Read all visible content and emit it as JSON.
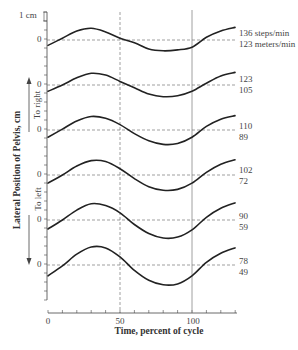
{
  "chart_data": {
    "type": "line",
    "title": "",
    "xlabel": "Time, percent of cycle",
    "ylabel": "Lateral Position of Pelvis, cm",
    "xlim": [
      0,
      130
    ],
    "xticks": [
      "0",
      "50",
      "100"
    ],
    "scale_bar": "1 cm",
    "direction_labels": {
      "up": "To right",
      "down": "To left"
    },
    "reference_lines": {
      "vertical_dashed": 50,
      "vertical_solid": 100
    },
    "series": [
      {
        "name": "136 steps/min, 123 meters/min",
        "cadence": "136 steps/min",
        "speed": "123 meters/min",
        "x": [
          0,
          10,
          20,
          30,
          40,
          50,
          60,
          70,
          80,
          90,
          100,
          110,
          120,
          130
        ],
        "values": [
          -0.6,
          0.2,
          1.0,
          1.3,
          0.9,
          0.2,
          -0.3,
          -1.0,
          -1.2,
          -1.1,
          -0.8,
          0.3,
          1.0,
          1.4
        ]
      },
      {
        "name": "123, 105",
        "cadence": "123",
        "speed": "105",
        "x": [
          0,
          10,
          20,
          30,
          40,
          50,
          60,
          70,
          80,
          90,
          100,
          110,
          120,
          130
        ],
        "values": [
          -0.7,
          0.0,
          0.8,
          1.3,
          1.1,
          0.4,
          -0.3,
          -1.0,
          -1.3,
          -1.2,
          -0.7,
          0.2,
          1.0,
          1.4
        ]
      },
      {
        "name": "110, 89",
        "cadence": "110",
        "speed": "89",
        "x": [
          0,
          10,
          20,
          30,
          40,
          50,
          60,
          70,
          80,
          90,
          100,
          110,
          120,
          130
        ],
        "values": [
          -0.8,
          0.1,
          1.0,
          1.5,
          1.3,
          0.6,
          -0.4,
          -1.2,
          -1.6,
          -1.5,
          -0.8,
          0.4,
          1.2,
          1.6
        ]
      },
      {
        "name": "102, 72",
        "cadence": "102",
        "speed": "72",
        "x": [
          0,
          10,
          20,
          30,
          40,
          50,
          60,
          70,
          80,
          90,
          100,
          110,
          120,
          130
        ],
        "values": [
          -0.9,
          0.0,
          1.0,
          1.6,
          1.5,
          0.7,
          -0.4,
          -1.3,
          -1.7,
          -1.6,
          -0.9,
          0.3,
          1.2,
          1.7
        ]
      },
      {
        "name": "90, 59",
        "cadence": "90",
        "speed": "59",
        "x": [
          0,
          10,
          20,
          30,
          40,
          50,
          60,
          70,
          80,
          90,
          100,
          110,
          120,
          130
        ],
        "values": [
          -1.0,
          0.0,
          1.1,
          1.8,
          1.6,
          0.8,
          -0.5,
          -1.5,
          -2.0,
          -1.9,
          -1.1,
          0.3,
          1.3,
          1.9
        ]
      },
      {
        "name": "78, 49",
        "cadence": "78",
        "speed": "49",
        "x": [
          0,
          10,
          20,
          30,
          40,
          50,
          60,
          70,
          80,
          90,
          100,
          110,
          120,
          130
        ],
        "values": [
          -1.2,
          -0.1,
          1.2,
          2.0,
          1.9,
          0.9,
          -0.6,
          -1.7,
          -2.2,
          -2.1,
          -1.2,
          0.3,
          1.3,
          1.9
        ]
      }
    ]
  },
  "labels": {
    "zero": "0",
    "s0_a": "136 steps/min",
    "s0_b": "123 meters/min",
    "s1_a": "123",
    "s1_b": "105",
    "s2_a": "110",
    "s2_b": "89",
    "s3_a": "102",
    "s3_b": "72",
    "s4_a": "90",
    "s4_b": "59",
    "s5_a": "78",
    "s5_b": "49",
    "x0": "0",
    "x50": "50",
    "x100": "100",
    "xlabel": "Time, percent of cycle",
    "ylabel": "Lateral Position of Pelvis, cm",
    "to_right": "To right",
    "to_left": "To left",
    "scale": "1 cm"
  }
}
